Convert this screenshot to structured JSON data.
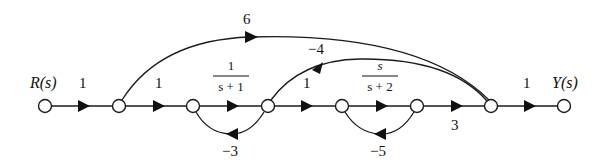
{
  "diagram": {
    "type": "signal-flow-graph",
    "input_label": "R(s)",
    "output_label": "Y(s)",
    "nodes": [
      "n1",
      "n2",
      "n3",
      "n4",
      "n5",
      "n6",
      "n7",
      "n8"
    ],
    "forward_gains": {
      "n1_n2": "1",
      "n2_n3": "1",
      "n3_n4": {
        "num": "1",
        "den": "s + 1"
      },
      "n4_n5": "1",
      "n5_n6": {
        "num": "s",
        "den": "s + 2"
      },
      "n6_n7": "3",
      "n7_n8": "1"
    },
    "feedback_gains": {
      "n4_n3": "−3",
      "n6_n5": "−5"
    },
    "feedforward_gains": {
      "n2_n7": "6",
      "n4_n7": "−4"
    }
  }
}
